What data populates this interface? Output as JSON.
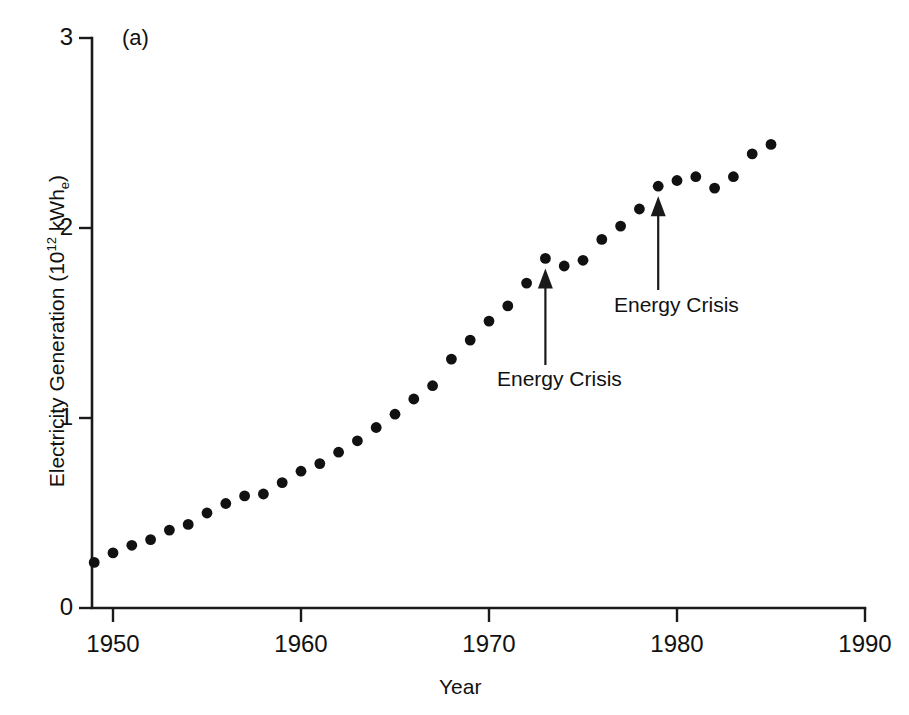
{
  "figure": {
    "panel_label": "(a)",
    "background": "#ffffff",
    "ink_color": "#111111"
  },
  "chart_data": {
    "type": "scatter",
    "title": "",
    "panel": "(a)",
    "xlabel": "Year",
    "ylabel": "Electricity Generation (10^12 kWh_e)",
    "ylabel_parts": {
      "prefix": "Electricity Generation (10",
      "superscript": "12",
      "middle": " kWh",
      "subscript": "e",
      "suffix": ")"
    },
    "xlim": [
      1948,
      1990
    ],
    "ylim": [
      0,
      3
    ],
    "xticks": [
      1950,
      1960,
      1970,
      1980,
      1990
    ],
    "xtick_labels": [
      "1950",
      "1960",
      "1970",
      "1980",
      "1990"
    ],
    "yticks": [
      0,
      1,
      2,
      3
    ],
    "ytick_labels": [
      "0",
      "1",
      "2",
      "3"
    ],
    "grid": false,
    "legend": null,
    "marker": "filled-circle",
    "x": [
      1949,
      1950,
      1951,
      1952,
      1953,
      1954,
      1955,
      1956,
      1957,
      1958,
      1959,
      1960,
      1961,
      1962,
      1963,
      1964,
      1965,
      1966,
      1967,
      1968,
      1969,
      1970,
      1971,
      1972,
      1973,
      1974,
      1975,
      1976,
      1977,
      1978,
      1979,
      1980,
      1981,
      1982,
      1983,
      1984,
      1985
    ],
    "values": [
      0.24,
      0.29,
      0.33,
      0.36,
      0.41,
      0.44,
      0.5,
      0.55,
      0.59,
      0.6,
      0.66,
      0.72,
      0.76,
      0.82,
      0.88,
      0.95,
      1.02,
      1.1,
      1.17,
      1.31,
      1.41,
      1.51,
      1.59,
      1.71,
      1.84,
      1.8,
      1.83,
      1.94,
      2.01,
      2.1,
      2.22,
      2.25,
      2.27,
      2.21,
      2.27,
      2.39,
      2.44
    ],
    "annotations": [
      {
        "text": "Energy Crisis",
        "year": 1973,
        "value": 1.84
      },
      {
        "text": "Energy Crisis",
        "year": 1979,
        "value": 2.22
      }
    ]
  }
}
